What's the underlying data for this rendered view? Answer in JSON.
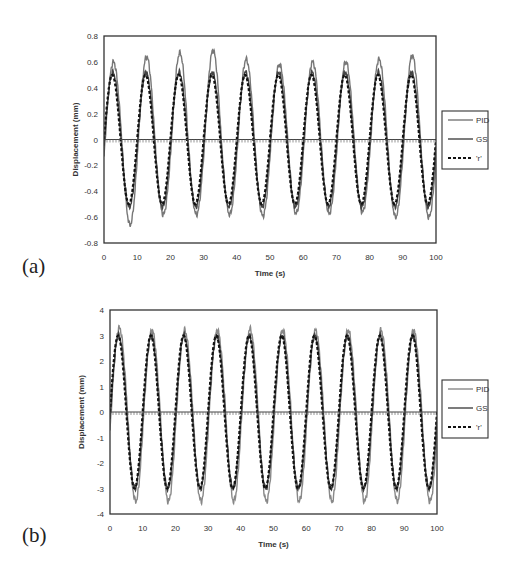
{
  "chart_data": [
    {
      "type": "line",
      "panel_label": "(a)",
      "title": "",
      "xlabel": "Time (s)",
      "ylabel": "Displacement (mm)",
      "xlim": [
        0,
        100
      ],
      "ylim": [
        -0.8,
        0.8
      ],
      "xticks": [
        0,
        10,
        20,
        30,
        40,
        50,
        60,
        70,
        80,
        90,
        100
      ],
      "yticks": [
        0.8,
        0.6,
        0.4,
        0.2,
        0,
        -0.2,
        -0.4,
        -0.6,
        -0.8
      ],
      "ytick_labels": [
        "0.8",
        "0.6",
        "0.4",
        "0.2",
        "0",
        "-0.2",
        "-0.4",
        "-0.6",
        "-0.8"
      ],
      "grid": false,
      "legend_position": "right",
      "signal": {
        "form": "sine",
        "period_s": 10,
        "zero_line": 0
      },
      "series": [
        {
          "name": "PID",
          "style": "solid",
          "color": "#777777",
          "amplitude": 0.55,
          "peak_values": [
            0.6,
            0.64,
            0.67,
            0.69,
            0.62,
            0.58,
            0.6,
            0.6,
            0.62,
            0.65
          ],
          "trough_values": [
            -0.66,
            -0.58,
            -0.58,
            -0.58,
            -0.59,
            -0.57,
            -0.57,
            -0.56,
            -0.6,
            -0.6
          ]
        },
        {
          "name": "GS",
          "style": "solid",
          "color": "#444444",
          "amplitude": 0.52
        },
        {
          "name": "'r'",
          "style": "dashed",
          "color": "#111111",
          "amplitude": 0.5
        }
      ]
    },
    {
      "type": "line",
      "panel_label": "(b)",
      "title": "",
      "xlabel": "Time (s)",
      "ylabel": "Displacement (mm)",
      "xlim": [
        0,
        100
      ],
      "ylim": [
        -4,
        4
      ],
      "xticks": [
        0,
        10,
        20,
        30,
        40,
        50,
        60,
        70,
        80,
        90,
        100
      ],
      "yticks": [
        4,
        3,
        2,
        1,
        0,
        -1,
        -2,
        -3,
        -4
      ],
      "ytick_labels": [
        "4",
        "3",
        "2",
        "1",
        "0",
        "-1",
        "-2",
        "-3",
        "-4"
      ],
      "grid": false,
      "legend_position": "right",
      "signal": {
        "form": "sine",
        "period_s": 10,
        "zero_line": 0
      },
      "series": [
        {
          "name": "PID",
          "style": "solid",
          "color": "#888888",
          "amplitude": 3.3,
          "peak_values": [
            3.3,
            3.2,
            3.2,
            3.2,
            3.25,
            3.2,
            3.2,
            3.2,
            3.2,
            3.2
          ],
          "trough_values": [
            -3.5,
            -3.5,
            -3.5,
            -3.5,
            -3.5,
            -3.5,
            -3.5,
            -3.5,
            -3.5,
            -3.5
          ]
        },
        {
          "name": "GS",
          "style": "solid",
          "color": "#444444",
          "amplitude": 3.0
        },
        {
          "name": "'r'",
          "style": "dashed",
          "color": "#111111",
          "amplitude": 3.0
        }
      ]
    }
  ]
}
